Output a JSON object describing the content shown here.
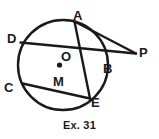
{
  "figure": {
    "caption": "Ex. 31",
    "stroke_color": "#1a1a1a",
    "fill_color": "#ffffff",
    "background": "#ffffff",
    "circle": {
      "name": "circle-outline",
      "center_x": 63,
      "center_y": 65,
      "radius": 45,
      "stroke_width": 2.4
    },
    "center_dot": {
      "name": "center-dot",
      "x": 59.5,
      "y": 65,
      "radius": 2.4
    },
    "labels": [
      {
        "id": "A",
        "text": "A",
        "x": 73,
        "y": 9
      },
      {
        "id": "D",
        "text": "D",
        "x": 7,
        "y": 32
      },
      {
        "id": "O",
        "text": "O",
        "x": 61,
        "y": 50
      },
      {
        "id": "P",
        "text": "P",
        "x": 139,
        "y": 46
      },
      {
        "id": "B",
        "text": "B",
        "x": 103,
        "y": 62
      },
      {
        "id": "C",
        "text": "C",
        "x": 4,
        "y": 81
      },
      {
        "id": "M",
        "text": "M",
        "x": 53,
        "y": 75
      },
      {
        "id": "E",
        "text": "E",
        "x": 91,
        "y": 96
      }
    ],
    "segments": [
      {
        "id": "D-to-P",
        "name": "secant-d-m-b-p",
        "x1": 20,
        "y1": 43,
        "x2": 136,
        "y2": 53,
        "stroke_width": 2.4
      },
      {
        "id": "A-to-P",
        "name": "secant-a-p",
        "x1": 79,
        "y1": 21,
        "x2": 136,
        "y2": 53,
        "stroke_width": 2.4
      },
      {
        "id": "C-to-E",
        "name": "chord-c-m-e",
        "x1": 23,
        "y1": 84,
        "x2": 90,
        "y2": 98,
        "stroke_width": 2.4
      },
      {
        "id": "A-to-E-alt",
        "name": "chord-a-m-e",
        "x1": 79,
        "y1": 21,
        "x2": 90,
        "y2": 98,
        "stroke_width": 2.4
      }
    ]
  }
}
